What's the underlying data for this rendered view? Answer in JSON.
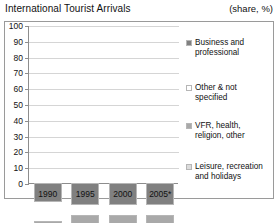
{
  "header": {
    "title": "International Tourist Arrivals",
    "units": "(share, %)"
  },
  "legend": {
    "items": [
      {
        "label": "Business and\nprofessional",
        "color": "#808080",
        "key": "business"
      },
      {
        "label": "Other & not\nspecified",
        "color": "#ffffff",
        "key": "other"
      },
      {
        "label": "VFR, health,\nreligion, other",
        "color": "#a9a9a9",
        "key": "vfr"
      },
      {
        "label": "Leisure, recreation\nand holidays",
        "color": "#dcdcdc",
        "key": "leisure"
      }
    ]
  },
  "chart_data": {
    "type": "bar",
    "stacked": true,
    "title": "International Tourist Arrivals",
    "xlabel": "",
    "ylabel": "",
    "unit": "share, %",
    "ylim": [
      0,
      100
    ],
    "yticks": [
      0,
      10,
      20,
      30,
      40,
      50,
      60,
      70,
      80,
      90,
      100
    ],
    "grid": true,
    "legend_position": "right",
    "categories": [
      "1990",
      "1995",
      "2000",
      "2005*"
    ],
    "series": [
      {
        "name": "Leisure, recreation and holidays",
        "color": "#dcdcdc",
        "values": [
          53,
          58,
          58,
          54
        ]
      },
      {
        "name": "VFR, health, religion, other",
        "color": "#a9a9a9",
        "values": [
          23,
          22,
          22,
          26
        ]
      },
      {
        "name": "Other & not specified",
        "color": "#ffffff",
        "values": [
          12,
          6,
          6,
          6
        ]
      },
      {
        "name": "Business and professional",
        "color": "#808080",
        "values": [
          12,
          14,
          14,
          14
        ]
      }
    ]
  }
}
